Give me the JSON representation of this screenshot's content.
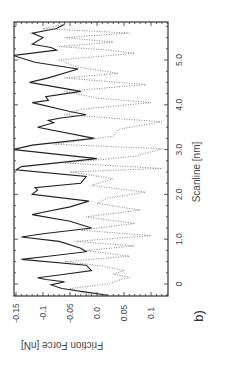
{
  "chart_data": {
    "type": "line",
    "orientation": "rotated-90-clockwise",
    "panel_label": "b)",
    "title": "",
    "xlabel": "Scanline  [nm]",
    "ylabel": "Friction  Force  [nN]",
    "xlim": [
      -0.25,
      5.85
    ],
    "ylim": [
      -0.16,
      0.145
    ],
    "x_ticks": [
      {
        "value": 0,
        "label": "0"
      },
      {
        "value": 1,
        "label": "1.0"
      },
      {
        "value": 2,
        "label": "2.0"
      },
      {
        "value": 3,
        "label": "3.0"
      },
      {
        "value": 4,
        "label": "4.0"
      },
      {
        "value": 5,
        "label": "5.0"
      }
    ],
    "y_ticks": [
      {
        "value": -0.15,
        "label": "-0.15"
      },
      {
        "value": -0.1,
        "label": "-0.1"
      },
      {
        "value": -0.05,
        "label": "-0.05"
      },
      {
        "value": 0.0,
        "label": "0.0"
      },
      {
        "value": 0.05,
        "label": "0.05"
      },
      {
        "value": 0.1,
        "label": "0.1"
      }
    ],
    "grid": false,
    "legend": null,
    "series": [
      {
        "name": "trace",
        "style": "solid",
        "color": "#222222",
        "x": [
          -0.25,
          -0.18,
          -0.1,
          -0.02,
          0.05,
          0.1,
          0.14,
          0.2,
          0.3,
          0.42,
          0.55,
          0.62,
          0.72,
          0.8,
          0.95,
          1.05,
          1.12,
          1.25,
          1.4,
          1.55,
          1.6,
          1.72,
          1.85,
          2.0,
          2.1,
          2.15,
          2.25,
          2.4,
          2.55,
          2.62,
          2.8,
          3.0,
          3.1,
          3.25,
          3.5,
          3.6,
          3.65,
          3.7,
          3.78,
          3.85,
          4.05,
          4.1,
          4.18,
          4.3,
          4.5,
          4.6,
          4.8,
          4.95,
          5.1,
          5.22,
          5.28,
          5.35,
          5.5,
          5.6,
          5.7,
          5.8
        ],
        "y": [
          0.02,
          -0.02,
          -0.065,
          -0.085,
          -0.06,
          -0.095,
          -0.11,
          -0.07,
          -0.01,
          -0.02,
          -0.14,
          -0.09,
          -0.02,
          -0.03,
          -0.07,
          -0.14,
          -0.1,
          -0.01,
          -0.05,
          -0.12,
          -0.1,
          -0.05,
          -0.015,
          -0.12,
          -0.11,
          -0.115,
          -0.03,
          -0.02,
          -0.15,
          -0.14,
          0.0,
          -0.155,
          -0.12,
          -0.005,
          -0.11,
          -0.08,
          -0.09,
          -0.07,
          -0.02,
          -0.05,
          -0.12,
          -0.09,
          -0.095,
          -0.03,
          -0.125,
          -0.09,
          -0.035,
          -0.115,
          -0.155,
          -0.075,
          -0.085,
          -0.12,
          -0.1,
          -0.12,
          -0.075,
          -0.06
        ]
      },
      {
        "name": "retrace",
        "style": "dotted",
        "color": "#777777",
        "x": [
          -0.25,
          -0.1,
          0.0,
          0.1,
          0.15,
          0.22,
          0.3,
          0.4,
          0.5,
          0.62,
          0.75,
          0.85,
          0.95,
          1.08,
          1.2,
          1.35,
          1.5,
          1.65,
          1.8,
          1.92,
          2.05,
          2.2,
          2.35,
          2.5,
          2.58,
          2.7,
          2.85,
          3.02,
          3.12,
          3.3,
          3.45,
          3.62,
          3.78,
          3.9,
          4.05,
          4.15,
          4.3,
          4.45,
          4.6,
          4.7,
          4.85,
          5.0,
          5.15,
          5.22,
          5.3,
          5.4,
          5.5,
          5.6,
          5.7,
          5.8
        ],
        "y": [
          -0.01,
          -0.05,
          0.02,
          0.045,
          0.06,
          0.03,
          0.05,
          0.01,
          -0.06,
          0.06,
          -0.02,
          0.07,
          -0.04,
          0.1,
          -0.03,
          0.07,
          -0.02,
          0.08,
          0.0,
          0.02,
          0.09,
          -0.01,
          0.03,
          -0.05,
          0.12,
          -0.06,
          0.07,
          0.12,
          -0.08,
          0.03,
          0.04,
          0.12,
          -0.06,
          -0.03,
          0.1,
          0.0,
          -0.06,
          0.09,
          -0.06,
          0.04,
          -0.04,
          -0.07,
          0.07,
          0.02,
          -0.07,
          0.03,
          -0.06,
          0.06,
          -0.1,
          -0.06
        ]
      }
    ]
  },
  "labels": {
    "panel": "b)",
    "xlabel": "Scanline  [nm]",
    "ylabel": "Friction  Force  [nN]"
  }
}
